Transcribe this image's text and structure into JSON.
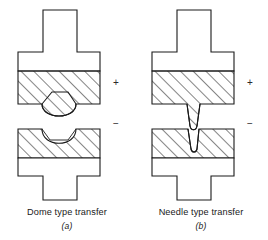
{
  "figure": {
    "type": "technical-line-diagram",
    "stroke_color": "#1a1a1a",
    "hatch_color": "#2b2b2b",
    "fill_color": "#ffffff",
    "background": "#ffffff"
  },
  "panels": [
    {
      "id": "dome",
      "caption_title": "Dome type transfer",
      "caption_letter": "(a)",
      "upper_electrode": {
        "polarity_label": "+",
        "polarity_name": "positive",
        "shape": "T-shaped electrode with narrow shank above wide head",
        "contact_layer": "cross-hatched band",
        "feature": "rounded dome protrusion on contact face"
      },
      "lower_electrode": {
        "polarity_label": "−",
        "polarity_name": "negative",
        "shape": "inverted T-shaped electrode with wide head above narrow shank",
        "contact_layer": "cross-hatched band",
        "feature": "rounded concave crater matching the dome"
      }
    },
    {
      "id": "needle",
      "caption_title": "Needle type transfer",
      "caption_letter": "(b)",
      "upper_electrode": {
        "polarity_label": "+",
        "polarity_name": "positive",
        "shape": "T-shaped electrode with narrow shank above wide head",
        "contact_layer": "cross-hatched band",
        "feature": "slender tapered needle spike on contact face"
      },
      "lower_electrode": {
        "polarity_label": "−",
        "polarity_name": "negative",
        "shape": "inverted T-shaped electrode with wide head above narrow shank",
        "contact_layer": "cross-hatched band",
        "feature": "narrow deep pit matching the needle"
      }
    }
  ]
}
